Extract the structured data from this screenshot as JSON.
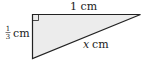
{
  "diagram": {
    "type": "right-triangle",
    "fill_color": "#ececec",
    "stroke_color": "#222222",
    "top_side": {
      "label": "1 cm"
    },
    "left_side": {
      "numerator": "1",
      "denominator": "3",
      "unit": "cm"
    },
    "hypotenuse": {
      "variable": "x",
      "unit": "cm"
    },
    "right_angle_marker": "top-left"
  }
}
